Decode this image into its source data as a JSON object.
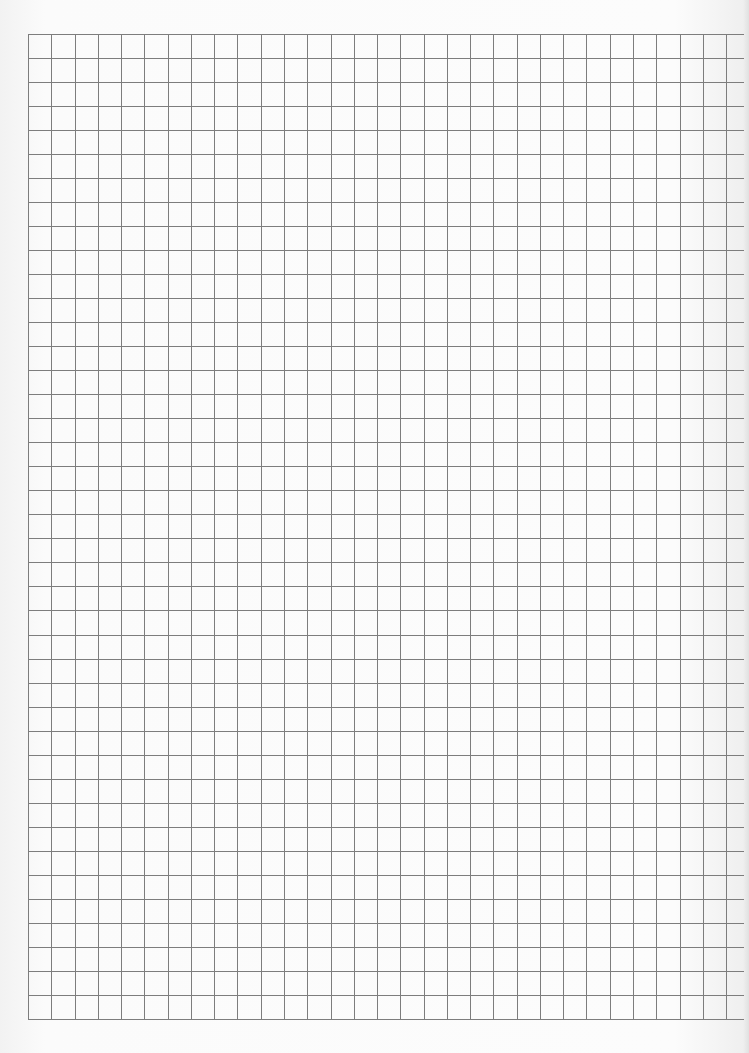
{
  "page": {
    "kind": "graph-paper",
    "background_color": "#fafafa",
    "line_color": "#7d7d7d"
  },
  "grid": {
    "left": 28,
    "top": 34,
    "bottom": 1019,
    "horizontal_line_right_end": 744,
    "column_pitch": 23.27,
    "row_pitch": 24.02,
    "vertical_line_count": 31,
    "horizontal_line_count": 42,
    "line_width": 1
  }
}
